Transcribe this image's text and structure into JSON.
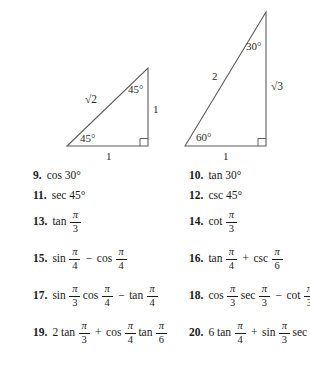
{
  "figures": {
    "left_triangle": {
      "name": "45-45-90-triangle",
      "hypotenuse_label": "√2",
      "vertical_leg_label": "1",
      "horizontal_leg_label": "1",
      "top_angle_label": "45°",
      "bottom_left_angle_label": "45°",
      "right_angle_marker": true,
      "geometry": {
        "apex": [
          148,
          68
        ],
        "bottom_left": [
          67,
          146
        ],
        "bottom_right": [
          148,
          146
        ]
      }
    },
    "right_triangle": {
      "name": "30-60-90-triangle",
      "hypotenuse_label": "2",
      "vertical_leg_label": "√3",
      "horizontal_leg_label": "1",
      "top_angle_label": "30°",
      "bottom_left_angle_label": "60°",
      "right_angle_marker": true,
      "geometry": {
        "apex": [
          266,
          12
        ],
        "bottom_left": [
          185,
          146
        ],
        "bottom_right": [
          266,
          146
        ]
      }
    }
  },
  "exercises": [
    {
      "number": "9.",
      "tokens": [
        {
          "t": "text",
          "v": "cos 30°"
        }
      ]
    },
    {
      "number": "10.",
      "tokens": [
        {
          "t": "text",
          "v": "tan 30°"
        }
      ]
    },
    {
      "number": "11.",
      "tokens": [
        {
          "t": "text",
          "v": "sec 45°"
        }
      ]
    },
    {
      "number": "12.",
      "tokens": [
        {
          "t": "text",
          "v": "csc 45°"
        }
      ]
    },
    {
      "number": "13.",
      "tokens": [
        {
          "t": "text",
          "v": "tan"
        },
        {
          "t": "frac",
          "num": "π",
          "den": "3"
        }
      ]
    },
    {
      "number": "14.",
      "tokens": [
        {
          "t": "text",
          "v": "cot"
        },
        {
          "t": "frac",
          "num": "π",
          "den": "3"
        }
      ]
    },
    {
      "number": "15.",
      "tokens": [
        {
          "t": "text",
          "v": "sin"
        },
        {
          "t": "frac",
          "num": "π",
          "den": "4"
        },
        {
          "t": "op",
          "v": "−"
        },
        {
          "t": "text",
          "v": "cos"
        },
        {
          "t": "frac",
          "num": "π",
          "den": "4"
        }
      ]
    },
    {
      "number": "16.",
      "tokens": [
        {
          "t": "text",
          "v": "tan"
        },
        {
          "t": "frac",
          "num": "π",
          "den": "4"
        },
        {
          "t": "op",
          "v": "+"
        },
        {
          "t": "text",
          "v": "csc"
        },
        {
          "t": "frac",
          "num": "π",
          "den": "6"
        }
      ]
    },
    {
      "number": "17.",
      "tokens": [
        {
          "t": "text",
          "v": "sin"
        },
        {
          "t": "frac",
          "num": "π",
          "den": "3"
        },
        {
          "t": "text",
          "v": "cos"
        },
        {
          "t": "frac",
          "num": "π",
          "den": "4"
        },
        {
          "t": "op",
          "v": "−"
        },
        {
          "t": "text",
          "v": "tan"
        },
        {
          "t": "frac",
          "num": "π",
          "den": "4"
        }
      ]
    },
    {
      "number": "18.",
      "tokens": [
        {
          "t": "text",
          "v": "cos"
        },
        {
          "t": "frac",
          "num": "π",
          "den": "3"
        },
        {
          "t": "text",
          "v": "sec"
        },
        {
          "t": "frac",
          "num": "π",
          "den": "3"
        },
        {
          "t": "op",
          "v": "−"
        },
        {
          "t": "text",
          "v": "cot"
        },
        {
          "t": "frac",
          "num": "π",
          "den": "3"
        }
      ]
    },
    {
      "number": "19.",
      "tokens": [
        {
          "t": "text",
          "v": "2 tan"
        },
        {
          "t": "frac",
          "num": "π",
          "den": "3"
        },
        {
          "t": "op",
          "v": "+"
        },
        {
          "t": "text",
          "v": "cos"
        },
        {
          "t": "frac",
          "num": "π",
          "den": "4"
        },
        {
          "t": "text",
          "v": "tan"
        },
        {
          "t": "frac",
          "num": "π",
          "den": "6"
        }
      ]
    },
    {
      "number": "20.",
      "tokens": [
        {
          "t": "text",
          "v": "6 tan"
        },
        {
          "t": "frac",
          "num": "π",
          "den": "4"
        },
        {
          "t": "op",
          "v": "+"
        },
        {
          "t": "text",
          "v": "sin"
        },
        {
          "t": "frac",
          "num": "π",
          "den": "3"
        },
        {
          "t": "text",
          "v": "sec"
        },
        {
          "t": "frac",
          "num": "π",
          "den": "6"
        }
      ]
    }
  ],
  "colors": {
    "ink": "#1a1a1a",
    "figure_stroke": "#5d5d5d",
    "page_background": "#ffffff"
  }
}
